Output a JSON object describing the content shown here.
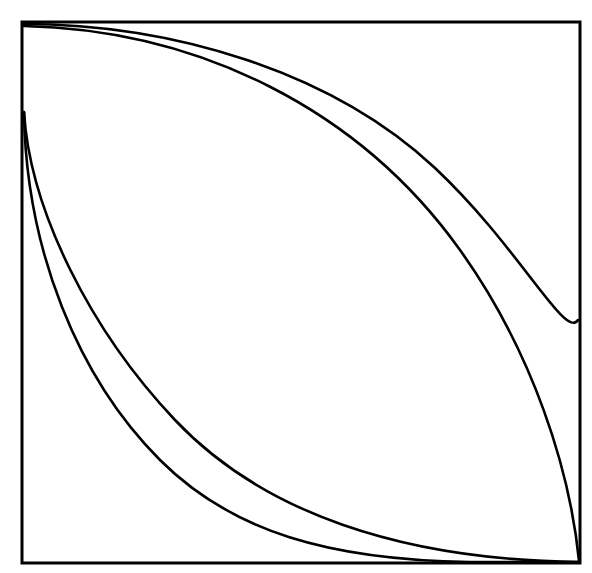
{
  "figure": {
    "canvas": {
      "width": 592,
      "height": 573
    },
    "background_color": "#ffffff",
    "stroke_color": "#000000",
    "frame": {
      "name": "rectangular-border",
      "x": 22,
      "y": 22,
      "width": 558,
      "height": 541,
      "stroke_width": 3,
      "fill": "none"
    },
    "curves": [
      {
        "name": "upper-outer-arc",
        "description": "Arc leaving the top-left corner tangent to the top border, bulging toward the top-right, meeting the right border tangentially at mid-height.",
        "stroke_width": 2.6,
        "path": "M 22 24 C 170 24 330 70 435 168 C 520 248 565 340 578 320"
      },
      {
        "name": "upper-inner-arc",
        "description": "Arc leaving the top-left corner tangent to the top border, running inside the outer arc and descending to the bottom-right corner.",
        "stroke_width": 2.6,
        "path": "M 24 26 C 200 30 360 110 460 250 C 533 352 570 470 579 561"
      },
      {
        "name": "lower-inner-arc",
        "description": "Arc leaving the left border tangentially near upper-left, sweeping down-right and becoming tangent to the bottom border before the bottom-right corner.",
        "stroke_width": 2.6,
        "path": "M 24 112 C 30 210 90 330 175 420 C 262 512 400 560 579 562"
      },
      {
        "name": "lower-outer-arc",
        "description": "Arc leaving the left border tangentially near upper-left, running outside the inner lower arc and meeting the bottom border earlier.",
        "stroke_width": 2.6,
        "path": "M 24 112 C 26 250 78 378 160 460 C 232 532 330 560 470 562 L 579 562"
      }
    ],
    "anchor_points": [
      {
        "name": "top-left-corner",
        "x": 22,
        "y": 22
      },
      {
        "name": "top-right-corner",
        "x": 580,
        "y": 22
      },
      {
        "name": "bottom-left-corner",
        "x": 22,
        "y": 563
      },
      {
        "name": "bottom-right-corner",
        "x": 580,
        "y": 563
      },
      {
        "name": "upper-arcs-origin",
        "x": 23,
        "y": 24
      },
      {
        "name": "lower-arcs-origin",
        "x": 24,
        "y": 112
      },
      {
        "name": "upper-outer-arc-right-terminus",
        "x": 578,
        "y": 320
      },
      {
        "name": "lower-inner-arc-bottom-tangency",
        "x": 330,
        "y": 560
      },
      {
        "name": "lower-outer-arc-bottom-tangency",
        "x": 470,
        "y": 562
      }
    ]
  }
}
